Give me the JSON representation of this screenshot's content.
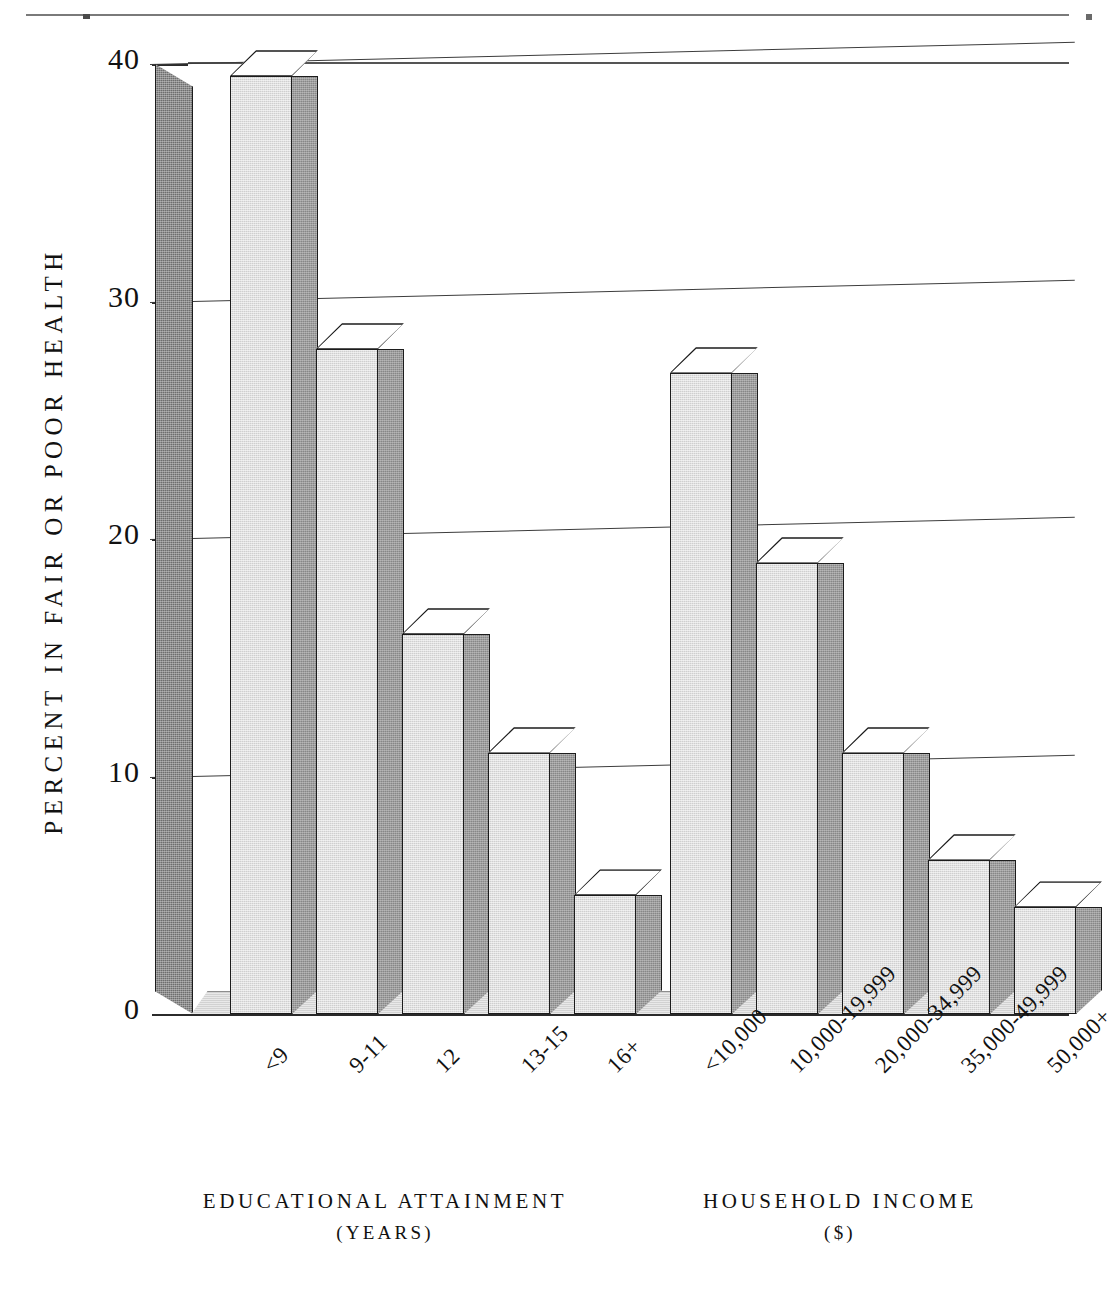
{
  "page": {
    "top_rule": true
  },
  "chart_data": {
    "type": "bar",
    "title": "",
    "subtitle": "",
    "ylabel": "PERCENT IN FAIR OR POOR HEALTH",
    "xlabel": "",
    "ylim": [
      0,
      40
    ],
    "yticks": [
      0,
      10,
      20,
      30,
      40
    ],
    "ytick_labels": [
      "0",
      "10",
      "20",
      "30",
      "40"
    ],
    "grid": true,
    "grid_axis": "y",
    "legend": "none",
    "style": "3d-bar",
    "groups": [
      {
        "name": "education",
        "axis_title": "EDUCATIONAL ATTAINMENT",
        "axis_subtitle": "(YEARS)",
        "categories": [
          "<9",
          "9-11",
          "12",
          "13-15",
          "16+"
        ],
        "values": [
          39.5,
          28.0,
          16.0,
          11.0,
          5.0
        ]
      },
      {
        "name": "income",
        "axis_title": "HOUSEHOLD INCOME",
        "axis_subtitle": "($)",
        "categories": [
          "<10,000",
          "10,000-19,999",
          "20,000-34,999",
          "35,000-49,999",
          "50,000+"
        ],
        "values": [
          27.0,
          19.0,
          11.0,
          6.5,
          4.5
        ]
      }
    ],
    "colors": {
      "bar_front": "#cfcfcf",
      "bar_side": "#878787",
      "bar_top": "#ffffff",
      "bar_outline": "#1c1c1c",
      "axis_wall": "#6e6e6e",
      "gridline": "#3c3c3c",
      "background": "#ffffff",
      "text": "#111111"
    }
  }
}
